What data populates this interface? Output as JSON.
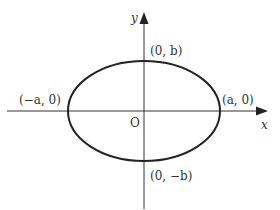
{
  "diagram": {
    "type": "ellipse-on-axes",
    "colors": {
      "stroke": "#222222",
      "axis": "#333333",
      "text": "#333333",
      "background": "#ffffff"
    },
    "axes": {
      "x_label": "x",
      "y_label": "y",
      "origin_label": "O"
    },
    "ellipse": {
      "center": [
        144,
        111
      ],
      "rx": 76,
      "ry": 50
    },
    "points": {
      "top": "(0, b)",
      "bottom": "(0, −b)",
      "left": "(−a, 0)",
      "right": "(a, 0)"
    }
  }
}
